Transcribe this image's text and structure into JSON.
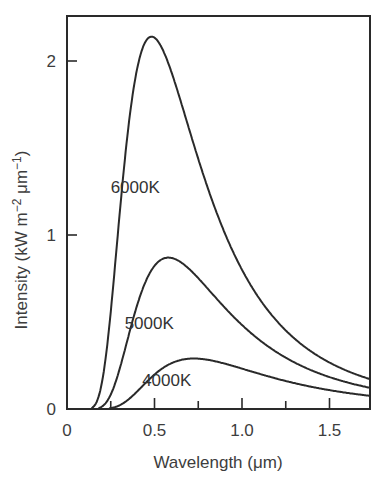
{
  "chart_data": {
    "type": "line",
    "title": "",
    "xlabel": "Wavelength (μm)",
    "ylabel": "Intensity (kW m⁻² μm⁻¹)",
    "ylabel_parts": {
      "main": "Intensity (kW m",
      "sup1": "−2",
      "mid": " μm",
      "sup2": "−1",
      "end": ")"
    },
    "xlim": [
      0,
      1.73
    ],
    "ylim": [
      0,
      2.26
    ],
    "grid": false,
    "legend": "none (inline curve labels)",
    "x_ticks_major": [
      {
        "value": 0,
        "label": "0"
      },
      {
        "value": 0.5,
        "label": "0.5"
      },
      {
        "value": 1.0,
        "label": "1.0"
      },
      {
        "value": 1.5,
        "label": "1.5"
      }
    ],
    "x_ticks_minor": [
      0.25,
      0.75,
      1.25
    ],
    "y_ticks": [
      {
        "value": 0,
        "label": "0"
      },
      {
        "value": 1,
        "label": "1"
      },
      {
        "value": 2,
        "label": "2"
      }
    ],
    "x": [
      0.15,
      0.2,
      0.25,
      0.3,
      0.35,
      0.4,
      0.45,
      0.48,
      0.5,
      0.55,
      0.6,
      0.65,
      0.7,
      0.75,
      0.8,
      0.9,
      1.0,
      1.1,
      1.2,
      1.3,
      1.4,
      1.5,
      1.6,
      1.73
    ],
    "series": [
      {
        "name": "6000K",
        "label": "6000K",
        "peak": {
          "x": 0.48,
          "y": 2.14
        },
        "values": [
          0.0,
          0.12,
          0.55,
          1.12,
          1.62,
          1.96,
          2.12,
          2.14,
          2.13,
          2.05,
          1.92,
          1.76,
          1.6,
          1.44,
          1.29,
          1.02,
          0.8,
          0.63,
          0.5,
          0.4,
          0.32,
          0.26,
          0.22,
          0.18
        ],
        "label_pos": {
          "x": 0.39,
          "y": 1.24
        }
      },
      {
        "name": "5000K",
        "label": "5000K",
        "peak": {
          "x": 0.59,
          "y": 0.87
        },
        "values": [
          0.0,
          0.02,
          0.1,
          0.28,
          0.47,
          0.63,
          0.75,
          0.81,
          0.84,
          0.87,
          0.87,
          0.85,
          0.81,
          0.76,
          0.71,
          0.6,
          0.5,
          0.41,
          0.34,
          0.28,
          0.23,
          0.19,
          0.16,
          0.14
        ],
        "label_pos": {
          "x": 0.47,
          "y": 0.46
        }
      },
      {
        "name": "4000K",
        "label": "4000K",
        "peak": {
          "x": 0.72,
          "y": 0.29
        },
        "values": [
          0.0,
          0.0,
          0.0,
          0.02,
          0.06,
          0.11,
          0.16,
          0.19,
          0.21,
          0.25,
          0.27,
          0.285,
          0.29,
          0.29,
          0.28,
          0.26,
          0.23,
          0.2,
          0.17,
          0.15,
          0.13,
          0.11,
          0.1,
          0.09
        ],
        "label_pos": {
          "x": 0.57,
          "y": 0.13
        }
      }
    ],
    "series_start_x": {
      "6000K": 0.14,
      "5000K": 0.18,
      "4000K": 0.24
    }
  },
  "colors": {
    "line": "#2a2a2a",
    "text": "#3d3d3d",
    "background": "#ffffff"
  }
}
